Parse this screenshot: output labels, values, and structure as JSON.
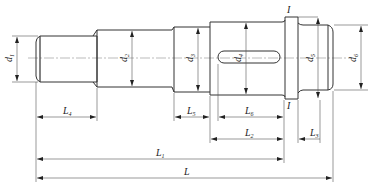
{
  "figure": {
    "type": "stepped-shaft-engineering-drawing",
    "section_mark": "I",
    "diameter_labels": [
      {
        "name": "d",
        "sub": "1"
      },
      {
        "name": "d",
        "sub": "2"
      },
      {
        "name": "d",
        "sub": "3"
      },
      {
        "name": "d",
        "sub": "4"
      },
      {
        "name": "d",
        "sub": "5"
      },
      {
        "name": "d",
        "sub": "6"
      }
    ],
    "length_labels": [
      {
        "name": "L",
        "sub": "4"
      },
      {
        "name": "L",
        "sub": "5"
      },
      {
        "name": "L",
        "sub": "6"
      },
      {
        "name": "L",
        "sub": "2"
      },
      {
        "name": "L",
        "sub": "3"
      },
      {
        "name": "L",
        "sub": "1"
      },
      {
        "name": "L",
        "sub": ""
      }
    ],
    "colors": {
      "line": "#333333",
      "background": "#ffffff"
    }
  }
}
